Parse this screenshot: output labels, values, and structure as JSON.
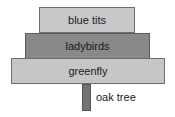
{
  "diagram": {
    "type": "pyramid-of-numbers",
    "levels": [
      {
        "label": "blue tits",
        "trophic_level": "tertiary consumer",
        "color": "#c9c9c9"
      },
      {
        "label": "ladybirds",
        "trophic_level": "secondary consumer",
        "color": "#8a8a8a"
      },
      {
        "label": "greenfly",
        "trophic_level": "primary consumer",
        "color": "#c6c6c6"
      }
    ],
    "producer": {
      "label": "oak tree",
      "color": "#737373"
    }
  }
}
